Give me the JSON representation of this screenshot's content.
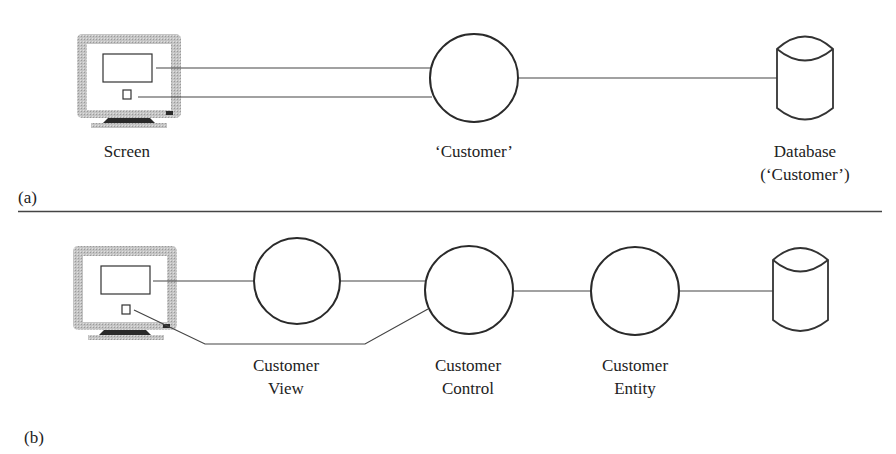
{
  "diagram": {
    "colors": {
      "line": "#333333",
      "monitor_frame": "#bdbdbd",
      "monitor_base": "#2a2a2a",
      "background": "#ffffff"
    },
    "panel_a": {
      "label": "(a)",
      "screen_label": "Screen",
      "object_label": "‘Customer’",
      "database_label_line1": "Database",
      "database_label_line2": "(‘Customer’)",
      "icons": [
        "monitor-icon",
        "object-circle",
        "database-cylinder-icon"
      ]
    },
    "panel_b": {
      "label": "(b)",
      "view_label_line1": "Customer",
      "view_label_line2": "View",
      "control_label_line1": "Customer",
      "control_label_line2": "Control",
      "entity_label_line1": "Customer",
      "entity_label_line2": "Entity",
      "icons": [
        "monitor-icon",
        "boundary-circle",
        "control-circle",
        "entity-circle",
        "database-cylinder-icon"
      ]
    }
  }
}
